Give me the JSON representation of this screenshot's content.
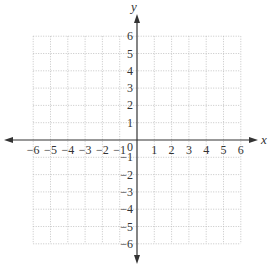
{
  "diagram": {
    "type": "coordinate-plane",
    "x_axis": {
      "label": "x",
      "min": -6,
      "max": 6,
      "ticks": [
        "-6",
        "-5",
        "-4",
        "-3",
        "-2",
        "-1",
        "1",
        "2",
        "3",
        "4",
        "5",
        "6"
      ]
    },
    "y_axis": {
      "label": "y",
      "min": -6,
      "max": 6,
      "ticks": [
        "6",
        "5",
        "4",
        "3",
        "2",
        "1",
        "-1",
        "-2",
        "-3",
        "-4",
        "-5",
        "-6"
      ]
    },
    "origin_label": "0",
    "grid": {
      "style": "dotted",
      "color": "#b8b8b8",
      "step": 1
    },
    "axis_color": "#333333"
  }
}
